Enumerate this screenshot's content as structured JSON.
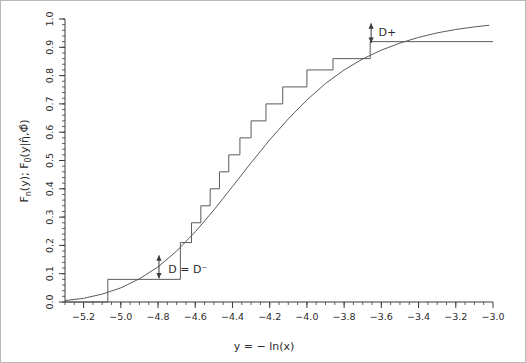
{
  "chart_data": {
    "type": "line",
    "title": "",
    "subtitle": "",
    "xlabel": "y  =  −  ln(x)",
    "ylabel_parts": {
      "fn": "F",
      "fn_sub": "n",
      "fn_arg": "(y);  F",
      "f0_sub": "0",
      "f0_arg": "(y|η̂,Φ̂)"
    },
    "ylabel": "Fₙ(y);  F₀(y|η̂,Φ̂)",
    "xlim": [
      -5.3,
      -3.0
    ],
    "ylim": [
      0.0,
      1.0
    ],
    "grid": false,
    "legend": "none",
    "xticks": [
      -5.2,
      -5.0,
      -4.8,
      -4.6,
      -4.4,
      -4.2,
      -4.0,
      -3.8,
      -3.6,
      -3.4,
      -3.2,
      -3.0
    ],
    "xtick_labels": [
      "-5.2",
      "-5.0",
      "-4.8",
      "-4.6",
      "-4.4",
      "-4.2",
      "-4.0",
      "-3.8",
      "-3.6",
      "-3.4",
      "-3.2",
      "-3.0"
    ],
    "yticks": [
      0.0,
      0.1,
      0.2,
      0.3,
      0.4,
      0.5,
      0.6,
      0.7,
      0.8,
      0.9,
      1.0
    ],
    "ytick_labels": [
      "0.0",
      "0.1",
      "0.2",
      "0.3",
      "0.4",
      "0.5",
      "0.6",
      "0.7",
      "0.8",
      "0.9",
      "1.0"
    ],
    "xminor_step": 0.05,
    "yminor_step": 0.02,
    "series": [
      {
        "name": "Empirical CDF (step)",
        "type": "step",
        "x": [
          -5.3,
          -5.07,
          -4.8,
          -4.68,
          -4.62,
          -4.57,
          -4.52,
          -4.47,
          -4.42,
          -4.36,
          -4.3,
          -4.22,
          -4.13,
          -4.0,
          -3.86,
          -3.66,
          -3.59,
          -3.0
        ],
        "y": [
          0.0,
          0.08,
          0.08,
          0.21,
          0.28,
          0.34,
          0.4,
          0.46,
          0.52,
          0.58,
          0.64,
          0.7,
          0.76,
          0.82,
          0.86,
          0.92,
          0.92,
          0.92
        ]
      },
      {
        "name": "Fitted parametric CDF",
        "type": "line",
        "x": [
          -5.3,
          -5.2,
          -5.1,
          -5.0,
          -4.9,
          -4.8,
          -4.7,
          -4.6,
          -4.5,
          -4.4,
          -4.3,
          -4.2,
          -4.1,
          -4.0,
          -3.9,
          -3.8,
          -3.7,
          -3.6,
          -3.5,
          -3.4,
          -3.3,
          -3.2,
          -3.1,
          -3.02
        ],
        "y": [
          0.005,
          0.013,
          0.028,
          0.05,
          0.082,
          0.124,
          0.18,
          0.248,
          0.325,
          0.408,
          0.492,
          0.573,
          0.647,
          0.714,
          0.772,
          0.82,
          0.859,
          0.89,
          0.915,
          0.935,
          0.951,
          0.963,
          0.972,
          0.978
        ]
      }
    ],
    "annotations": [
      {
        "name": "d-plus",
        "label": "D+",
        "x": -3.655,
        "y_top": 0.985,
        "y_bottom": 0.915,
        "label_x": -3.615,
        "label_y": 0.955
      },
      {
        "name": "d-minus",
        "label": "D = D⁻",
        "x": -4.795,
        "y_top": 0.165,
        "y_bottom": 0.083,
        "label_x": -4.745,
        "label_y": 0.118
      }
    ],
    "colors": {
      "axis": "#3a3a3a",
      "step_line": "#5a5a5a",
      "curve_line": "#5a5a5a",
      "text": "#2b2b2b",
      "frame": "#b8b8b8",
      "background": "#ffffff"
    }
  }
}
